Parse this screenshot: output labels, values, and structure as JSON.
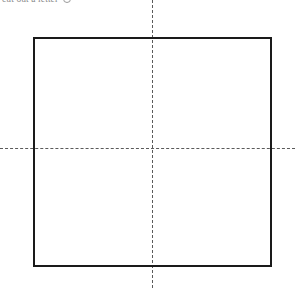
{
  "figure": {
    "caption": "cut out a letter",
    "caption_mark": "circle-glyph",
    "canvas": {
      "width": 301,
      "height": 291,
      "background": "#ffffff"
    },
    "square": {
      "label": "square-outline",
      "x": 33,
      "y": 37,
      "width": 239,
      "height": 230,
      "stroke_color": "#1a1a1a",
      "stroke_width": 2
    },
    "vertical_centerline": {
      "label": "vertical-centerline",
      "x": 152,
      "y_start": 0,
      "y_end": 288,
      "color": "#5a5a5a",
      "dash": "8px 5px"
    },
    "horizontal_centerline": {
      "label": "horizontal-centerline",
      "y": 148,
      "x_start": 0,
      "x_end": 295,
      "color": "#5a5a5a",
      "dash": "8px 5px"
    },
    "center_point": {
      "label": "center-intersection",
      "x": 152,
      "y": 148
    }
  }
}
